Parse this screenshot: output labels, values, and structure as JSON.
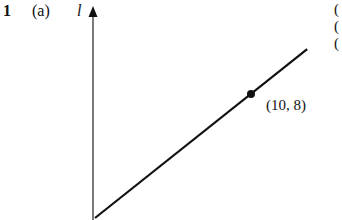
{
  "question": {
    "number": "1",
    "part": "(a)"
  },
  "clipped_right_margin_text": [
    "(",
    "(",
    "("
  ],
  "chart_data": {
    "type": "line",
    "title": "",
    "xlabel": "",
    "ylabel": "l",
    "grid": false,
    "axes": {
      "y_axis_arrow": true,
      "x_axis_shown": false
    },
    "series": [
      {
        "name": "line",
        "x": [
          0,
          13.6
        ],
        "y": [
          0,
          10.9
        ],
        "style": "solid"
      }
    ],
    "marked_points": [
      {
        "x": 10,
        "y": 8,
        "label": "(10, 8)"
      }
    ],
    "xlim": [
      0,
      13.6
    ],
    "ylim": [
      0,
      13.5
    ]
  }
}
